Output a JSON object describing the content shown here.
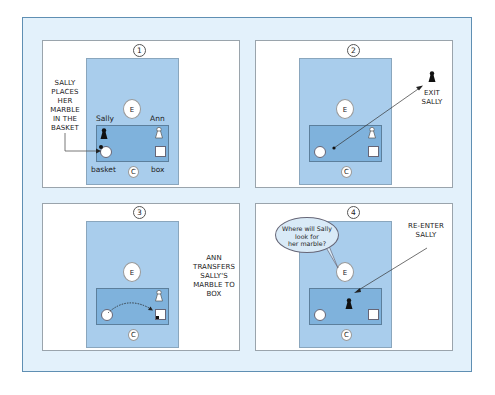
{
  "panels": [
    {
      "number": "1",
      "caption": [
        "SALLY",
        "PLACES",
        "HER",
        "MARBLE",
        "IN THE",
        "BASKET"
      ],
      "labels": {
        "sally": "Sally",
        "ann": "Ann",
        "basket": "basket",
        "box": "box"
      },
      "experimenter": "E",
      "child": "C"
    },
    {
      "number": "2",
      "caption": [
        "EXIT",
        "SALLY"
      ],
      "experimenter": "E",
      "child": "C"
    },
    {
      "number": "3",
      "caption": [
        "ANN",
        "TRANSFERS",
        "SALLY'S",
        "MARBLE TO",
        "BOX"
      ],
      "experimenter": "E",
      "child": "C"
    },
    {
      "number": "4",
      "caption": [
        "RE-ENTER",
        "SALLY"
      ],
      "question": [
        "Where will Sally",
        "look for",
        "her marble?"
      ],
      "experimenter": "E",
      "child": "C"
    }
  ],
  "colors": {
    "frame_bg": "#e3f1fb",
    "frame_border": "#5f8fb3",
    "room": "#a9cdec",
    "table": "#7fb2dc"
  }
}
